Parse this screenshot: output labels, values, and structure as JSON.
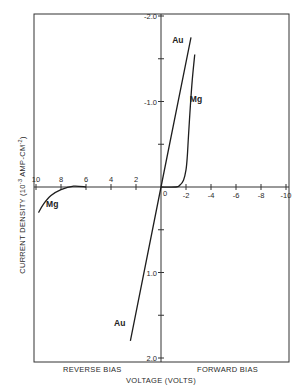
{
  "chart_data": {
    "type": "line",
    "title": "",
    "xlabel": "VOLTAGE (VOLTS)",
    "ylabel": "CURRENT DENSITY (10^-3 AMP-CM^-2)",
    "ylabel_parts": {
      "pre": "CURRENT DENSITY (10",
      "exp1": "-3",
      "mid": " AMP-CM",
      "exp2": "-2",
      "post": ")"
    },
    "xlim": [
      10,
      -10
    ],
    "ylim": [
      2.0,
      -2.0
    ],
    "x_ticks": [
      10,
      8,
      6,
      4,
      2,
      0,
      -2,
      -4,
      -6,
      -8,
      -10
    ],
    "x_tick_labels": [
      "10",
      "8",
      "6",
      "4",
      "2",
      "0",
      "-2",
      "-4",
      "-6",
      "-8",
      "-10"
    ],
    "y_ticks": [
      -2.0,
      -1.5,
      -1.0,
      -0.5,
      0.5,
      1.0,
      1.5,
      2.0
    ],
    "y_tick_labels": [
      {
        "value": -2.0,
        "label": "-2.0"
      },
      {
        "value": -1.0,
        "label": "-1.0"
      },
      {
        "value": 1.0,
        "label": "1.0"
      },
      {
        "value": 2.0,
        "label": "2.0"
      }
    ],
    "region_labels": {
      "reverse": "REVERSE BIAS",
      "forward": "FORWARD BIAS"
    },
    "grid": false,
    "series": [
      {
        "name": "Au",
        "points": [
          [
            2.45,
            1.8
          ],
          [
            0,
            0
          ],
          [
            -2.4,
            -1.75
          ]
        ],
        "labels": [
          {
            "text": "Au",
            "x": 3.3,
            "y": 1.62
          },
          {
            "text": "Au",
            "x": -1.35,
            "y": -1.68
          }
        ]
      },
      {
        "name": "Mg",
        "segment": "forward",
        "points": [
          [
            0,
            0
          ],
          [
            -1.2,
            0
          ],
          [
            -1.5,
            -0.02
          ],
          [
            -1.8,
            -0.08
          ],
          [
            -2.0,
            -0.2
          ],
          [
            -2.1,
            -0.35
          ],
          [
            -2.2,
            -0.6
          ],
          [
            -2.35,
            -0.95
          ],
          [
            -2.5,
            -1.25
          ],
          [
            -2.7,
            -1.55
          ]
        ],
        "labels": [
          {
            "text": "Mg",
            "x": -2.8,
            "y": -1.0
          }
        ]
      },
      {
        "name": "Mg",
        "segment": "reverse",
        "points": [
          [
            6,
            0
          ],
          [
            7,
            -0.01
          ],
          [
            8,
            0.03
          ],
          [
            8.8,
            0.1
          ],
          [
            9.4,
            0.2
          ],
          [
            9.8,
            0.3
          ]
        ],
        "labels": [
          {
            "text": "Mg",
            "x": 8.7,
            "y": 0.23
          }
        ]
      }
    ]
  }
}
